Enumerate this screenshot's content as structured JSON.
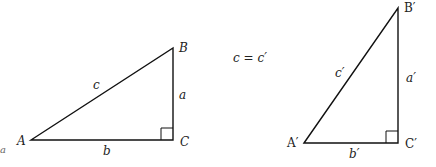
{
  "diagram": {
    "type": "two right triangles with congruent hypotenuses",
    "line_color": "#111111",
    "equation": "c = c′",
    "triangle_left": {
      "vertices": {
        "A": "A",
        "B": "B",
        "C": "C"
      },
      "sides": {
        "a": "a",
        "b": "b",
        "c": "c"
      },
      "right_angle_at": "C"
    },
    "triangle_right": {
      "vertices": {
        "A": "A′",
        "B": "B′",
        "C": "C′"
      },
      "sides": {
        "a": "a′",
        "b": "b′",
        "c": "c′"
      },
      "right_angle_at": "C′"
    },
    "edge_mark": "a"
  }
}
